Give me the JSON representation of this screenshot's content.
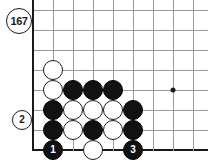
{
  "figure": {
    "number_label": "167",
    "badge_name": "diagram-number-badge"
  },
  "board": {
    "type": "go-board-corner-diagram",
    "colors": {
      "grid": "#9a9a9a",
      "edge": "#1a1a1a",
      "black_stone": "#111111",
      "white_stone": "#ffffff",
      "background": "#ffffff"
    },
    "geometry": {
      "origin_x": 33,
      "origin_y": 10,
      "spacing": 20,
      "cols": 9,
      "rows": 8,
      "left_edge_col": 0,
      "bottom_edge_row": 7
    },
    "star_points": [
      {
        "col": 7,
        "row": 4
      }
    ],
    "stones": [
      {
        "id": "w-c1-r3",
        "color": "white",
        "col": 1,
        "row": 3,
        "label": ""
      },
      {
        "id": "w-c1-r4",
        "color": "white",
        "col": 1,
        "row": 4,
        "label": ""
      },
      {
        "id": "b-c2-r4",
        "color": "black",
        "col": 2,
        "row": 4,
        "label": ""
      },
      {
        "id": "b-c3-r4",
        "color": "black",
        "col": 3,
        "row": 4,
        "label": ""
      },
      {
        "id": "b-c4-r4",
        "color": "black",
        "col": 4,
        "row": 4,
        "label": ""
      },
      {
        "id": "b-c1-r5",
        "color": "black",
        "col": 1,
        "row": 5,
        "label": ""
      },
      {
        "id": "w-c2-r5",
        "color": "white",
        "col": 2,
        "row": 5,
        "label": ""
      },
      {
        "id": "w-c3-r5",
        "color": "white",
        "col": 3,
        "row": 5,
        "label": ""
      },
      {
        "id": "w-c4-r5",
        "color": "white",
        "col": 4,
        "row": 5,
        "label": ""
      },
      {
        "id": "b-c5-r5",
        "color": "black",
        "col": 5,
        "row": 5,
        "label": ""
      },
      {
        "id": "b-c1-r6",
        "color": "black",
        "col": 1,
        "row": 6,
        "label": ""
      },
      {
        "id": "w-c2-r6",
        "color": "white",
        "col": 2,
        "row": 6,
        "label": ""
      },
      {
        "id": "b-c3-r6",
        "color": "black",
        "col": 3,
        "row": 6,
        "label": ""
      },
      {
        "id": "w-c4-r6",
        "color": "white",
        "col": 4,
        "row": 6,
        "label": ""
      },
      {
        "id": "b-c5-r6",
        "color": "black",
        "col": 5,
        "row": 6,
        "label": ""
      },
      {
        "id": "b-c1-r7",
        "color": "black",
        "col": 1,
        "row": 7,
        "label": "1"
      },
      {
        "id": "w-c3-r7",
        "color": "white",
        "col": 3,
        "row": 7,
        "label": ""
      },
      {
        "id": "b-c5-r7",
        "color": "black",
        "col": 5,
        "row": 7,
        "label": "3"
      }
    ],
    "offboard_stones": [
      {
        "id": "w-move-2",
        "color": "white",
        "x": 22,
        "y": 120,
        "label": "2"
      }
    ]
  }
}
